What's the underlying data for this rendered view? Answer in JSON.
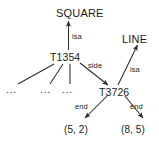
{
  "diagram": {
    "kind": "semantic-network",
    "background_color": "#ffffff",
    "stroke_color": "#2b2b2b",
    "text_color": "#1a1a1a",
    "nodes": {
      "square": "SQUARE",
      "line": "LINE",
      "t1354": "T1354",
      "t3726": "T3726",
      "point_left": "(5, 2)",
      "point_right": "(8, 5)",
      "ellipsis_1": "...",
      "ellipsis_2": "...",
      "ellipsis_3": "..."
    },
    "edges": {
      "isa_square": "isa",
      "isa_line": "isa",
      "side": "side",
      "end_left": "end",
      "end_right": "end"
    }
  }
}
